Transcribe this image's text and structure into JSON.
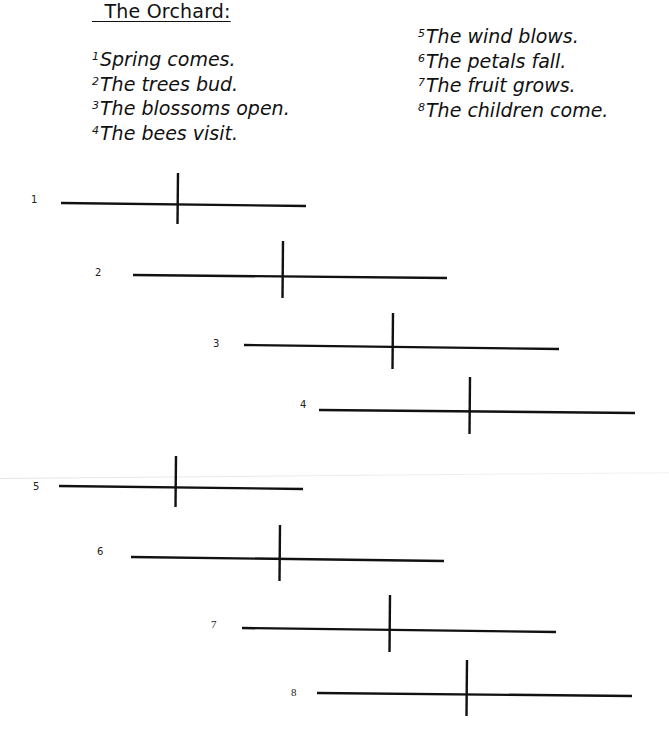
{
  "worksheet": {
    "title": "  The Orchard:",
    "sentences_left": [
      {
        "num": "1",
        "text": "Spring comes."
      },
      {
        "num": "2",
        "text": "The trees bud."
      },
      {
        "num": "3",
        "text": "The blossoms open."
      },
      {
        "num": "4",
        "text": "The bees visit."
      }
    ],
    "sentences_right": [
      {
        "num": "5",
        "text": "The wind blows."
      },
      {
        "num": "6",
        "text": "The petals fall."
      },
      {
        "num": "7",
        "text": "The fruit grows."
      },
      {
        "num": "8",
        "text": "The children come."
      }
    ],
    "diagrams": [
      {
        "label": "1",
        "lx": 31,
        "ly": 194,
        "x1": 61,
        "y1": 203,
        "x2": 306,
        "y2": 206,
        "vx": 178,
        "vt": 173,
        "vb": 224
      },
      {
        "label": "2",
        "lx": 95,
        "ly": 267,
        "x1": 133,
        "y1": 275,
        "x2": 447,
        "y2": 278,
        "vx": 283,
        "vt": 241,
        "vb": 298
      },
      {
        "label": "3",
        "lx": 213,
        "ly": 338,
        "x1": 244,
        "y1": 345,
        "x2": 559,
        "y2": 349,
        "vx": 393,
        "vt": 313,
        "vb": 369
      },
      {
        "label": "4",
        "lx": 300,
        "ly": 399,
        "x1": 319,
        "y1": 410,
        "x2": 635,
        "y2": 413,
        "vx": 470,
        "vt": 377,
        "vb": 434
      },
      {
        "label": "5",
        "lx": 33,
        "ly": 481,
        "x1": 59,
        "y1": 486,
        "x2": 303,
        "y2": 489,
        "vx": 176,
        "vt": 456,
        "vb": 507
      },
      {
        "label": "6",
        "lx": 97,
        "ly": 546,
        "x1": 131,
        "y1": 557,
        "x2": 444,
        "y2": 561,
        "vx": 280,
        "vt": 525,
        "vb": 581
      },
      {
        "label": "7",
        "lx": 211,
        "ly": 618,
        "x1": 242,
        "y1": 628,
        "x2": 556,
        "y2": 632,
        "vx": 390,
        "vt": 595,
        "vb": 652
      },
      {
        "label": "8",
        "lx": 291,
        "ly": 686,
        "x1": 317,
        "y1": 693,
        "x2": 632,
        "y2": 696,
        "vx": 467,
        "vt": 660,
        "vb": 716
      }
    ],
    "line_color": "#111111",
    "line_width": 2.4
  }
}
